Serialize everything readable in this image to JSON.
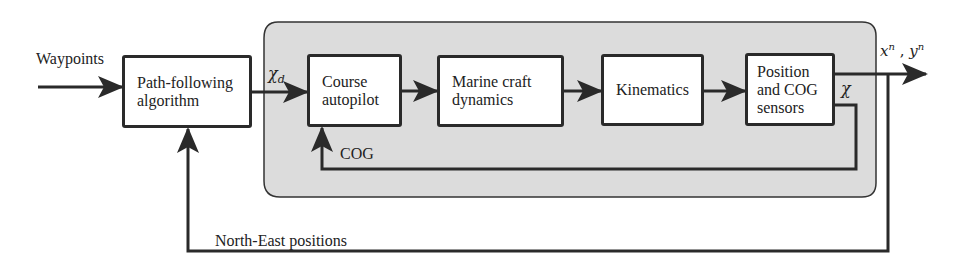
{
  "diagram": {
    "type": "block-diagram",
    "colors": {
      "line": "#2a2a2a",
      "subsystem_fill": "#dcdcdc",
      "block_fill": "#ffffff"
    },
    "blocks": [
      {
        "id": "path",
        "line1": "Path-following",
        "line2": "algorithm"
      },
      {
        "id": "autopilot",
        "line1": "Course",
        "line2": "autopilot"
      },
      {
        "id": "dynamics",
        "line1": "Marine craft",
        "line2": "dynamics"
      },
      {
        "id": "kinematics",
        "line1": "Kinematics"
      },
      {
        "id": "sensors",
        "line1": "Position",
        "line2": "and COG",
        "line3": "sensors"
      }
    ],
    "signals": {
      "input": "Waypoints",
      "chi_d": "χ",
      "chi_d_sub": "d",
      "chi": "χ",
      "cog": "COG",
      "output_x": "x",
      "output_y": "y",
      "output_sup": "n",
      "output_sep": " , ",
      "feedback": "North-East positions"
    }
  }
}
